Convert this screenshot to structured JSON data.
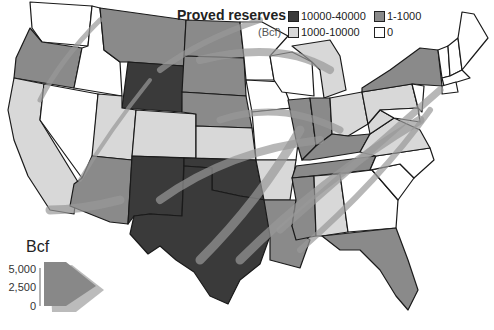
{
  "legend": {
    "title": "Proved reserves",
    "unit": "(Bcf)",
    "items": [
      {
        "label": "10000-40000",
        "color": "#3a3a3a"
      },
      {
        "label": "1-1000",
        "color": "#8a8a8a"
      },
      {
        "label": "1000-10000",
        "color": "#d8d8d8"
      },
      {
        "label": "0",
        "color": "#ffffff"
      }
    ]
  },
  "flow_scale": {
    "title": "Bcf",
    "ticks": [
      "5,000",
      "2,500",
      "0"
    ]
  },
  "colors": {
    "dark": "#3a3a3a",
    "medium": "#8a8a8a",
    "light": "#d8d8d8",
    "none": "#ffffff",
    "flow": "#999999",
    "outline": "#1a1a1a"
  }
}
